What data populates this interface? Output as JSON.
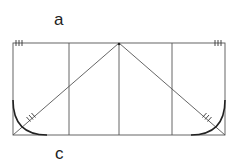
{
  "diagram": {
    "labels": {
      "top": "a",
      "bottom": "c"
    },
    "colors": {
      "line": "#555555",
      "curve": "#222222",
      "text": "#222222",
      "background": "#ffffff"
    },
    "rectangle": {
      "x": 13,
      "y": 43,
      "width": 212,
      "height": 92
    },
    "vertical_dividers_x": [
      69,
      119,
      172
    ],
    "apex": {
      "x": 119,
      "y": 43
    },
    "tick_marks": {
      "top_left": 3,
      "top_right": 3,
      "diagonal_left": 3,
      "diagonal_right": 3
    }
  }
}
